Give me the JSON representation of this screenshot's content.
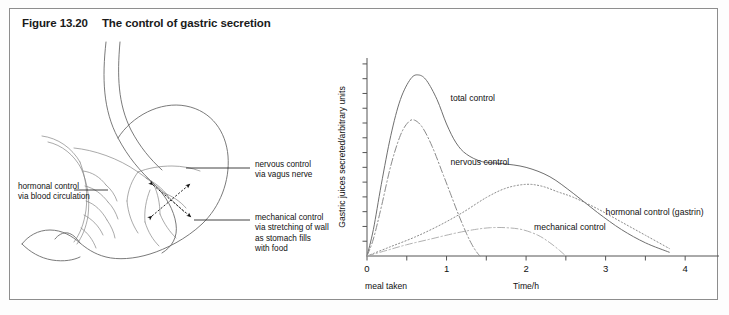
{
  "figure": {
    "number": "Figure 13.20",
    "title": "The control of gastric secretion"
  },
  "diagram": {
    "name": "stomach-cross-section",
    "annotations": [
      {
        "id": "nervous",
        "text": "nervous control\nvia vagus nerve"
      },
      {
        "id": "hormonal",
        "text": "hormonal control\nvia blood circulation"
      },
      {
        "id": "mechanical",
        "text": "mechanical control\nvia stretching of wall\nas stomach fills\nwith food"
      }
    ]
  },
  "chart_data": {
    "type": "line",
    "title": "",
    "xlabel": "Time/h",
    "ylabel": "Gastric juices secreted/arbitrary units",
    "xlim": [
      0,
      4.35
    ],
    "ylim": [
      0,
      105
    ],
    "grid": false,
    "legend_position": "inline-annotations",
    "x_ticks": [
      0,
      0.5,
      1,
      1.5,
      2,
      2.5,
      3,
      3.5,
      4
    ],
    "x_tick_labels": [
      "0",
      "",
      "1",
      "",
      "2",
      "",
      "3",
      "",
      "4"
    ],
    "y_ticks_count": 13,
    "y_tick_labels": [],
    "origin_note": "meal taken",
    "series": [
      {
        "name": "total control",
        "style": "solid",
        "label_x": 1.05,
        "label_y": 82,
        "x": [
          0,
          0.08,
          0.18,
          0.3,
          0.42,
          0.55,
          0.65,
          0.75,
          0.88,
          1.0,
          1.12,
          1.25,
          1.45,
          1.7,
          2.0,
          2.3,
          2.6,
          2.9,
          3.2,
          3.5,
          3.8
        ],
        "y": [
          0,
          14,
          38,
          64,
          83,
          94,
          96,
          93,
          83,
          70,
          60,
          54,
          50,
          49,
          47,
          42,
          33,
          23,
          14,
          7,
          2
        ]
      },
      {
        "name": "nervous control",
        "style": "dash-dot",
        "label_x": 1.05,
        "label_y": 48,
        "x": [
          0,
          0.08,
          0.18,
          0.3,
          0.42,
          0.52,
          0.6,
          0.7,
          0.82,
          0.95,
          1.05,
          1.15,
          1.25,
          1.32,
          1.38,
          1.42
        ],
        "y": [
          0,
          9,
          26,
          48,
          64,
          71,
          72,
          68,
          58,
          44,
          33,
          22,
          12,
          6,
          2,
          0
        ]
      },
      {
        "name": "hormonal control (gastrin)",
        "style": "dotted",
        "label_x": 3.0,
        "label_y": 22,
        "x": [
          0,
          0.3,
          0.6,
          0.9,
          1.2,
          1.5,
          1.75,
          2.0,
          2.2,
          2.4,
          2.6,
          2.9,
          3.2,
          3.5,
          3.8
        ],
        "y": [
          0,
          5,
          10,
          16,
          23,
          31,
          36,
          38,
          37,
          34,
          31,
          25,
          18,
          11,
          4
        ]
      },
      {
        "name": "mechanical control",
        "style": "dash-dot-light",
        "label_x": 2.1,
        "label_y": 14,
        "x": [
          0,
          0.25,
          0.5,
          0.8,
          1.1,
          1.35,
          1.55,
          1.75,
          1.95,
          2.15,
          2.3,
          2.42,
          2.5
        ],
        "y": [
          0,
          3,
          6,
          9,
          12,
          14,
          15,
          15,
          14,
          11,
          7,
          3,
          0
        ]
      }
    ]
  }
}
